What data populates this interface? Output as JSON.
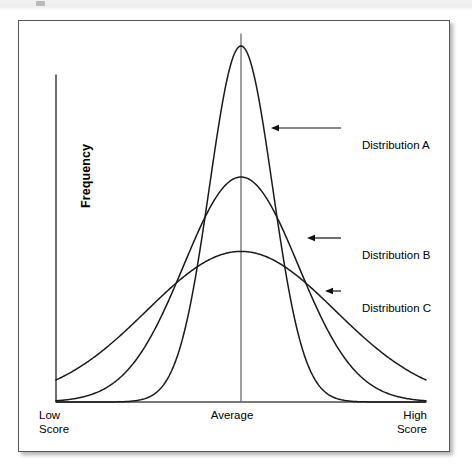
{
  "figure": {
    "axes": {
      "y_label": "Frequency",
      "x_tick_low": "Low\nScore",
      "x_tick_mid": "Average",
      "x_tick_high": "High\nScore"
    },
    "callouts": [
      {
        "id": "a",
        "label": "Distribution A"
      },
      {
        "id": "b",
        "label": "Distribution B"
      },
      {
        "id": "c",
        "label": "Distribution C"
      }
    ],
    "colors": {
      "curve_stroke": "#1a1a1a",
      "axis_stroke": "#4a4a4a",
      "center_line": "#6b6b6b",
      "frame_border": "#555555",
      "background": "#ffffff"
    }
  },
  "chart_data": {
    "type": "line",
    "title": "",
    "xlabel": "",
    "ylabel": "Frequency",
    "grid": false,
    "legend": "annotated-callouts",
    "x_tick_labels": [
      "Low Score",
      "Average",
      "High Score"
    ],
    "x_tick_positions": [
      0,
      0.5,
      1
    ],
    "xlim": [
      0,
      1
    ],
    "ylim": [
      0,
      1
    ],
    "series": [
      {
        "name": "Distribution A",
        "shape": "gaussian",
        "mean": 0.5,
        "sigma": 0.085,
        "peak_height": 1.0,
        "note": "tallest and narrowest; least variability"
      },
      {
        "name": "Distribution B",
        "shape": "gaussian",
        "mean": 0.5,
        "sigma": 0.155,
        "peak_height": 0.632,
        "note": "intermediate height and spread"
      },
      {
        "name": "Distribution C",
        "shape": "gaussian",
        "mean": 0.5,
        "sigma": 0.255,
        "peak_height": 0.423,
        "note": "flattest and widest; most variability"
      }
    ]
  }
}
